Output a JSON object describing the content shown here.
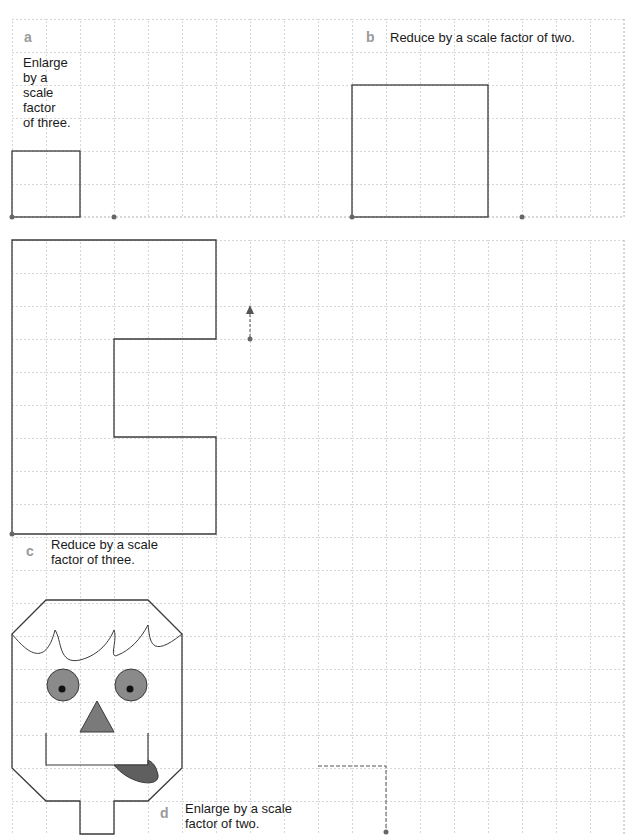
{
  "colors": {
    "grid": "#a8a8a8",
    "outline": "#3a3a3a",
    "eye_fill": "#8a8a8a",
    "nose_fill": "#7a7a7a",
    "tongue_fill": "#5f5f5f",
    "label_letter": "#9a9a9a",
    "text": "#1a1a1a"
  },
  "grid": {
    "cell_width": 34,
    "cell_height": 33
  },
  "questions": [
    {
      "letter": "a",
      "instruction_lines": [
        "Enlarge",
        "by a",
        "scale",
        "factor",
        "of three."
      ]
    },
    {
      "letter": "b",
      "instruction_lines": [
        "Reduce by a scale factor of two."
      ]
    },
    {
      "letter": "c",
      "instruction_lines": [
        "Reduce by a scale",
        "factor of three."
      ]
    },
    {
      "letter": "d",
      "instruction_lines": [
        "Enlarge by a scale",
        "factor of two."
      ]
    }
  ]
}
